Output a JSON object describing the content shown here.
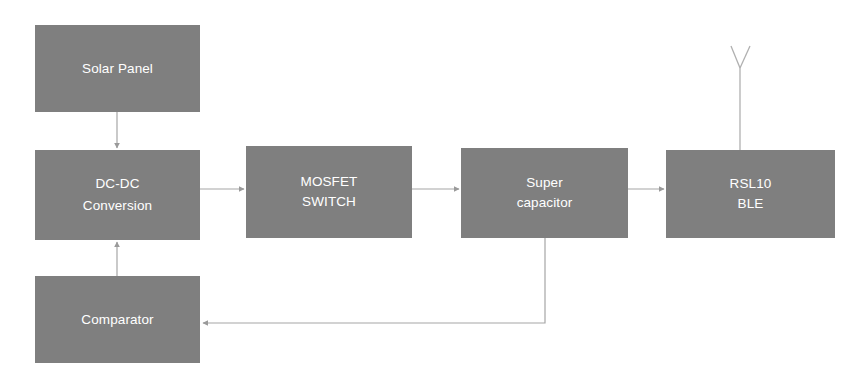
{
  "diagram": {
    "background_color": "#ffffff",
    "block_fill_color": "#7f7f7f",
    "block_text_color": "#ffffff",
    "wire_color": "#a6a6a6",
    "blocks": [
      {
        "id": "solar-panel",
        "lines": [
          "Solar Panel"
        ]
      },
      {
        "id": "dc-dc-conversion",
        "lines": [
          "DC-DC",
          "Conversion"
        ]
      },
      {
        "id": "mosfet-switch",
        "lines": [
          "MOSFET",
          "SWITCH"
        ]
      },
      {
        "id": "super-capacitor",
        "lines": [
          "Super",
          "capacitor"
        ]
      },
      {
        "id": "rsl10-ble",
        "lines": [
          "RSL10",
          "BLE"
        ]
      },
      {
        "id": "comparator",
        "lines": [
          "Comparator"
        ]
      }
    ],
    "connections": [
      {
        "from": "solar-panel",
        "to": "dc-dc-conversion",
        "direction": "down"
      },
      {
        "from": "dc-dc-conversion",
        "to": "mosfet-switch",
        "direction": "right"
      },
      {
        "from": "mosfet-switch",
        "to": "super-capacitor",
        "direction": "right"
      },
      {
        "from": "super-capacitor",
        "to": "rsl10-ble",
        "direction": "right"
      },
      {
        "from": "super-capacitor",
        "to": "comparator",
        "direction": "feedback-left"
      },
      {
        "from": "comparator",
        "to": "dc-dc-conversion",
        "direction": "up"
      }
    ],
    "antenna": {
      "attached_to": "rsl10-ble",
      "label": ""
    }
  }
}
